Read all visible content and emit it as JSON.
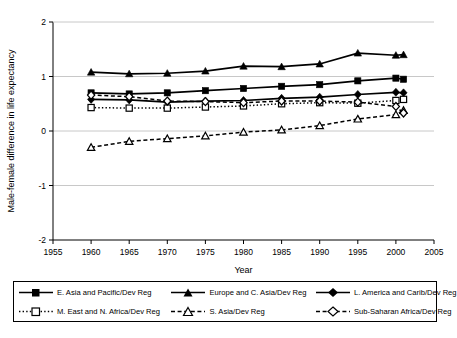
{
  "chart_data": {
    "type": "line",
    "title": "",
    "xlabel": "Year",
    "ylabel": "Male-female difference in life expectancy",
    "xlim": [
      1955,
      2005
    ],
    "ylim": [
      -2,
      2
    ],
    "xticks": [
      1955,
      1960,
      1965,
      1970,
      1975,
      1980,
      1985,
      1990,
      1995,
      2000,
      2005
    ],
    "yticks": [
      -2,
      -1,
      0,
      1,
      2
    ],
    "grid": true,
    "legend_position": "bottom",
    "x": [
      1960,
      1965,
      1970,
      1975,
      1980,
      1985,
      1990,
      1995,
      2000,
      2001
    ],
    "series": [
      {
        "name": "E. Asia and Pacific/Dev Reg",
        "marker": "filled-square",
        "line": "solid",
        "values": [
          0.7,
          0.68,
          0.7,
          0.74,
          0.78,
          0.82,
          0.85,
          0.92,
          0.97,
          0.95
        ]
      },
      {
        "name": "Europe and C. Asia/Dev Reg",
        "marker": "filled-triangle",
        "line": "solid",
        "values": [
          1.08,
          1.05,
          1.06,
          1.1,
          1.19,
          1.18,
          1.23,
          1.43,
          1.39,
          1.4
        ]
      },
      {
        "name": "L. America and Carib/Dev Reg",
        "marker": "filled-diamond",
        "line": "solid",
        "values": [
          0.58,
          0.57,
          0.53,
          0.55,
          0.56,
          0.6,
          0.62,
          0.67,
          0.71,
          0.7
        ]
      },
      {
        "name": "M. East and N. Africa/Dev Reg",
        "marker": "open-square",
        "line": "dotted",
        "values": [
          0.43,
          0.42,
          0.42,
          0.44,
          0.46,
          0.5,
          0.52,
          0.51,
          0.56,
          0.58
        ]
      },
      {
        "name": "S. Asia/Dev Reg",
        "marker": "open-triangle",
        "line": "dashed",
        "values": [
          -0.3,
          -0.19,
          -0.14,
          -0.09,
          -0.02,
          0.02,
          0.1,
          0.22,
          0.3,
          0.38
        ]
      },
      {
        "name": "Sub-Saharan Africa/Dev Reg",
        "marker": "open-diamond",
        "line": "dashed",
        "values": [
          0.66,
          0.63,
          0.55,
          0.54,
          0.52,
          0.55,
          0.55,
          0.53,
          0.45,
          0.33
        ]
      }
    ]
  },
  "legend": {
    "items": [
      {
        "label": "E. Asia and Pacific/Dev Reg"
      },
      {
        "label": "Europe and C. Asia/Dev Reg"
      },
      {
        "label": "L. America and Carib/Dev Reg"
      },
      {
        "label": "M. East and N. Africa/Dev Reg"
      },
      {
        "label": "S. Asia/Dev Reg"
      },
      {
        "label": "Sub-Saharan Africa/Dev Reg"
      }
    ]
  },
  "colors": {
    "line": "#000000",
    "grid": "#c8c8c8",
    "axis": "#000000",
    "background": "#ffffff"
  }
}
